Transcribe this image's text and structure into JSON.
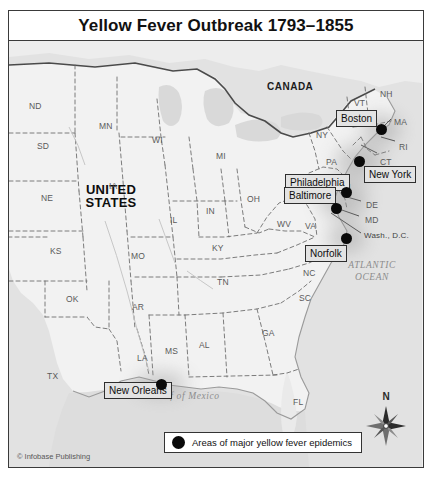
{
  "title": "Yellow Fever Outbreak 1793–1855",
  "copyright": "© Infobase Publishing",
  "legend": {
    "symbol": "black-circle",
    "text": "Areas of major yellow fever epidemics"
  },
  "compass": {
    "north_label": "N",
    "icon": "compass-rose"
  },
  "colors": {
    "land": "#f1f1f1",
    "ocean": "#dedede",
    "border_line": "#6a6a6a",
    "frame": "#3a3a3a",
    "dot": "#0a0a0a",
    "callout_fill": "#e3e3e3"
  },
  "countries": [
    {
      "name": "CANADA",
      "x": 258,
      "y": 46
    },
    {
      "name": "UNITED\nSTATES",
      "line1": "UNITED",
      "line2": "STATES",
      "x": 70,
      "y": 148
    }
  ],
  "water_bodies": [
    {
      "name": "ATLANTIC OCEAN",
      "line1": "ATLANTIC",
      "line2": "OCEAN",
      "x": 362,
      "y": 252
    },
    {
      "name": "Gulf of Mexico",
      "line1": "Gulf of Mexico",
      "x": 177,
      "y": 386
    }
  ],
  "states": [
    {
      "abbr": "ND",
      "x": 20,
      "y": 60
    },
    {
      "abbr": "SD",
      "x": 28,
      "y": 100
    },
    {
      "abbr": "NE",
      "x": 32,
      "y": 152
    },
    {
      "abbr": "KS",
      "x": 41,
      "y": 205
    },
    {
      "abbr": "OK",
      "x": 57,
      "y": 253
    },
    {
      "abbr": "TX",
      "x": 38,
      "y": 330
    },
    {
      "abbr": "MN",
      "x": 90,
      "y": 80
    },
    {
      "abbr": "IA",
      "x": 100,
      "y": 140
    },
    {
      "abbr": "MO",
      "x": 122,
      "y": 210
    },
    {
      "abbr": "AR",
      "x": 123,
      "y": 261
    },
    {
      "abbr": "LA",
      "x": 128,
      "y": 312
    },
    {
      "abbr": "WI",
      "x": 143,
      "y": 94
    },
    {
      "abbr": "IL",
      "x": 161,
      "y": 174
    },
    {
      "abbr": "MS",
      "x": 156,
      "y": 305
    },
    {
      "abbr": "MI",
      "x": 207,
      "y": 110
    },
    {
      "abbr": "IN",
      "x": 197,
      "y": 165
    },
    {
      "abbr": "AL",
      "x": 190,
      "y": 299
    },
    {
      "abbr": "KY",
      "x": 203,
      "y": 202
    },
    {
      "abbr": "TN",
      "x": 208,
      "y": 236
    },
    {
      "abbr": "OH",
      "x": 238,
      "y": 153
    },
    {
      "abbr": "GA",
      "x": 253,
      "y": 287
    },
    {
      "abbr": "WV",
      "x": 268,
      "y": 178
    },
    {
      "abbr": "VA",
      "x": 296,
      "y": 180
    },
    {
      "abbr": "NC",
      "x": 294,
      "y": 227
    },
    {
      "abbr": "SC",
      "x": 290,
      "y": 252
    },
    {
      "abbr": "FL",
      "x": 284,
      "y": 356
    },
    {
      "abbr": "PA",
      "x": 317,
      "y": 116
    },
    {
      "abbr": "NY",
      "x": 307,
      "y": 89
    },
    {
      "abbr": "NJ",
      "x": 331,
      "y": 141
    },
    {
      "abbr": "DE",
      "x": 357,
      "y": 159
    },
    {
      "abbr": "MD",
      "x": 356,
      "y": 174
    },
    {
      "abbr": "VT",
      "x": 345,
      "y": 57
    },
    {
      "abbr": "NH",
      "x": 371,
      "y": 48
    },
    {
      "abbr": "MA",
      "x": 385,
      "y": 76
    },
    {
      "abbr": "RI",
      "x": 390,
      "y": 101
    },
    {
      "abbr": "CT",
      "x": 371,
      "y": 116
    }
  ],
  "special_places": [
    {
      "label": "Wash., D.C.",
      "x": 358,
      "y": 194
    }
  ],
  "epidemic_cities": [
    {
      "name": "Boston",
      "dot_x": 372,
      "dot_y": 88,
      "box_x": 327,
      "box_y": 69,
      "dot_r": 5.5
    },
    {
      "name": "New York",
      "dot_x": 350,
      "dot_y": 120,
      "box_x": 355,
      "box_y": 125,
      "dot_r": 5.5
    },
    {
      "name": "Philadelphia",
      "dot_x": 337,
      "dot_y": 151,
      "box_x": 276,
      "box_y": 133,
      "dot_r": 5.5
    },
    {
      "name": "Baltimore",
      "dot_x": 327,
      "dot_y": 167,
      "box_x": 275,
      "box_y": 146,
      "dot_r": 5.5
    },
    {
      "name": "Norfolk",
      "dot_x": 337,
      "dot_y": 197,
      "box_x": 296,
      "box_y": 204,
      "dot_r": 5.5
    },
    {
      "name": "New Orleans",
      "dot_x": 152,
      "dot_y": 343,
      "box_x": 95,
      "box_y": 341,
      "dot_r": 5.5
    }
  ]
}
